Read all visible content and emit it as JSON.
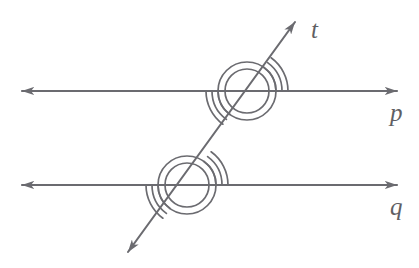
{
  "figure": {
    "background_color": "#ffffff",
    "stroke_color": "#6b6b70",
    "label_color": "#5f5f64",
    "width": 419,
    "height": 268
  },
  "labels": {
    "transversal": "t",
    "line_upper": "p",
    "line_lower": "q"
  },
  "geometry": {
    "lines": [
      {
        "name": "line-p",
        "label": "p",
        "type": "double-arrow-horizontal",
        "y": 91,
        "x_start": 22,
        "x_end": 397,
        "label_x": 390,
        "label_y": 115
      },
      {
        "name": "line-q",
        "label": "q",
        "type": "double-arrow-horizontal",
        "y": 185,
        "x_start": 22,
        "x_end": 397,
        "label_x": 390,
        "label_y": 209
      },
      {
        "name": "transversal-t",
        "label": "t",
        "type": "double-arrow-oblique",
        "x_start": 128,
        "y_start": 252,
        "x_end": 295,
        "y_end": 22,
        "angle_degrees": 54,
        "label_x": 311,
        "label_y": 32
      }
    ],
    "intersections": [
      {
        "name": "intersection-upper",
        "on_line": "p",
        "x": 247,
        "y": 91,
        "circle_radii": [
          22,
          29
        ],
        "arc_radii": [
          29,
          35,
          41
        ],
        "arc_quadrants": [
          "upper-right",
          "lower-left"
        ]
      },
      {
        "name": "intersection-lower",
        "on_line": "q",
        "x": 187,
        "y": 185,
        "circle_radii": [
          22,
          29
        ],
        "arc_radii": [
          29,
          35,
          41
        ],
        "arc_quadrants": [
          "upper-right",
          "lower-left"
        ]
      }
    ]
  }
}
